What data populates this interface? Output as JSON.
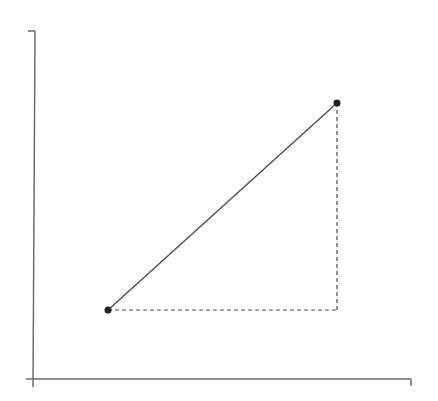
{
  "diagram": {
    "type": "right-triangle-slope",
    "colors": {
      "axis": "#6b6b6b",
      "line": "#4a4a4a",
      "dashed": "#4a4a4a",
      "point": "#222222",
      "background": "#ffffff"
    },
    "axes": {
      "origin": [
        33,
        379
      ],
      "y_axis_top": [
        35,
        31
      ],
      "y_axis_top_tick": [
        28,
        31
      ],
      "y_axis_bottom": [
        33,
        387
      ],
      "x_axis_left": [
        26,
        379
      ],
      "x_axis_right": [
        411,
        379
      ],
      "x_axis_right_tick": [
        411,
        386
      ]
    },
    "points": [
      {
        "name": "point-a",
        "x": 108,
        "y": 310
      },
      {
        "name": "point-b",
        "x": 337,
        "y": 103
      }
    ],
    "segment": {
      "from": "point-a",
      "to": "point-b",
      "style": "solid"
    },
    "legs": [
      {
        "name": "horizontal-leg",
        "from": [
          108,
          310
        ],
        "to": [
          337,
          310
        ],
        "style": "dashed"
      },
      {
        "name": "vertical-leg",
        "from": [
          337,
          103
        ],
        "to": [
          337,
          310
        ],
        "style": "dashed"
      }
    ]
  }
}
